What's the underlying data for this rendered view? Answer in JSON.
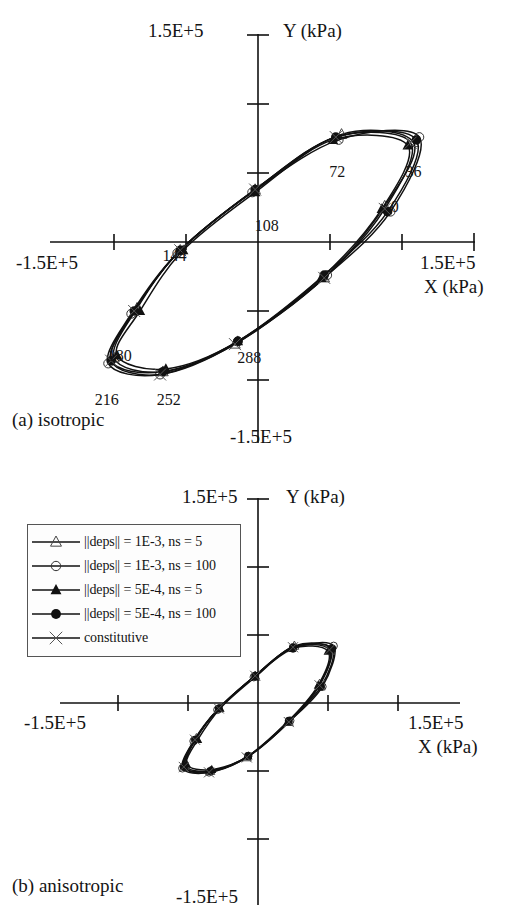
{
  "figure": {
    "panels": [
      {
        "key": "a",
        "caption": "(a) isotropic"
      },
      {
        "key": "b",
        "caption": "(b) anisotropic"
      }
    ]
  },
  "axes": {
    "y_top_label": "1.5E+5",
    "y_bottom_label": "-1.5E+5",
    "x_left_label": "-1.5E+5",
    "x_right_label": "1.5E+5",
    "y_axis_name": "Y (kPa)",
    "x_axis_name": "X (kPa)"
  },
  "legend": {
    "entries": [
      {
        "marker": "open-triangle",
        "label": "||deps|| = 1E-3, ns = 5"
      },
      {
        "marker": "open-circle",
        "label": "||deps|| = 1E-3, ns = 100"
      },
      {
        "marker": "filled-triangle",
        "label": "||deps|| = 5E-4, ns = 5"
      },
      {
        "marker": "filled-circle",
        "label": "||deps|| = 5E-4, ns = 100"
      },
      {
        "marker": "cross",
        "label": "constitutive"
      }
    ]
  },
  "point_labels_a": [
    "0",
    "36",
    "72",
    "108",
    "144",
    "180",
    "216",
    "252",
    "288",
    "324"
  ],
  "chart_data": {
    "type": "line",
    "title": "",
    "xlabel": "X (kPa)",
    "ylabel": "Y (kPa)",
    "xlim": [
      -150000,
      150000
    ],
    "ylim": [
      -150000,
      150000
    ],
    "xticks": [
      -150000,
      -100000,
      -50000,
      0,
      50000,
      100000,
      150000
    ],
    "yticks": [
      -150000,
      -100000,
      -50000,
      0,
      50000,
      100000,
      150000
    ],
    "xticklabels": [
      "-1.5E+5",
      "",
      "",
      "",
      "",
      "",
      "1.5E+5"
    ],
    "yticklabels": [
      "-1.5E+5",
      "",
      "",
      "",
      "",
      "",
      "1.5E+5"
    ],
    "grid": false,
    "legend_position": "outside-left-middle",
    "panels": [
      {
        "name": "(a) isotropic",
        "annotations": [
          {
            "text": "0",
            "x": 95000,
            "y": 22000
          },
          {
            "text": "36",
            "x": 108000,
            "y": 47000
          },
          {
            "text": "72",
            "x": 55000,
            "y": 47000
          },
          {
            "text": "108",
            "x": 6000,
            "y": 8000
          },
          {
            "text": "144",
            "x": -58000,
            "y": -14000
          },
          {
            "text": "180",
            "x": -96000,
            "y": -86000
          },
          {
            "text": "216",
            "x": -105000,
            "y": -118000
          },
          {
            "text": "252",
            "x": -62000,
            "y": -118000
          },
          {
            "text": "288",
            "x": -6000,
            "y": -88000
          }
        ],
        "series": [
          {
            "name": "||deps|| = 1E-3, ns = 5",
            "marker": "open-triangle",
            "phase_deg": [
              0,
              36,
              72,
              108,
              144,
              180,
              216,
              252,
              288,
              324
            ],
            "x": [
              88000,
              108000,
              58000,
              -2000,
              -54000,
              -84000,
              -100000,
              -66000,
              -16000,
              46000
            ],
            "y": [
              26000,
              72000,
              78000,
              38000,
              -6000,
              -48000,
              -84000,
              -94000,
              -74000,
              -26000
            ]
          },
          {
            "name": "||deps|| = 1E-3, ns = 100",
            "marker": "open-circle",
            "phase_deg": [
              0,
              36,
              72,
              108,
              144,
              180,
              216,
              252,
              288,
              324
            ],
            "x": [
              92000,
              112000,
              56000,
              -4000,
              -56000,
              -88000,
              -104000,
              -68000,
              -14000,
              48000
            ],
            "y": [
              22000,
              76000,
              74000,
              36000,
              -8000,
              -52000,
              -88000,
              -96000,
              -72000,
              -24000
            ]
          },
          {
            "name": "||deps|| = 5E-4, ns = 5",
            "marker": "filled-triangle",
            "phase_deg": [
              0,
              36,
              72,
              108,
              144,
              180,
              216,
              252,
              288,
              324
            ],
            "x": [
              86000,
              104000,
              52000,
              -2000,
              -52000,
              -82000,
              -98000,
              -64000,
              -14000,
              44000
            ],
            "y": [
              24000,
              70000,
              74000,
              36000,
              -6000,
              -50000,
              -82000,
              -92000,
              -72000,
              -26000
            ]
          },
          {
            "name": "||deps|| = 5E-4, ns = 100",
            "marker": "filled-circle",
            "phase_deg": [
              0,
              36,
              72,
              108,
              144,
              180,
              216,
              252,
              288,
              324
            ],
            "x": [
              90000,
              110000,
              54000,
              -2000,
              -54000,
              -86000,
              -102000,
              -66000,
              -14000,
              46000
            ],
            "y": [
              22000,
              74000,
              76000,
              38000,
              -6000,
              -50000,
              -86000,
              -94000,
              -72000,
              -24000
            ]
          },
          {
            "name": "constitutive",
            "marker": "cross",
            "phase_deg": [
              0,
              36,
              72,
              108,
              144,
              180,
              216,
              252,
              288,
              324
            ],
            "x": [
              88000,
              106000,
              54000,
              -2000,
              -54000,
              -86000,
              -102000,
              -68000,
              -16000,
              46000
            ],
            "y": [
              24000,
              72000,
              76000,
              38000,
              -6000,
              -50000,
              -86000,
              -96000,
              -74000,
              -26000
            ]
          }
        ]
      },
      {
        "name": "(b) anisotropic",
        "annotations": [],
        "series": [
          {
            "name": "||deps|| = 1E-3, ns = 5",
            "marker": "open-triangle",
            "phase_deg": [
              0,
              36,
              72,
              108,
              144,
              180,
              216,
              252,
              288,
              324
            ],
            "x": [
              44000,
              52000,
              26000,
              -2000,
              -28000,
              -44000,
              -52000,
              -34000,
              -8000,
              22000
            ],
            "y": [
              14000,
              40000,
              42000,
              20000,
              -4000,
              -26000,
              -46000,
              -50000,
              -40000,
              -14000
            ]
          },
          {
            "name": "||deps|| = 1E-3, ns = 100",
            "marker": "open-circle",
            "phase_deg": [
              0,
              36,
              72,
              108,
              144,
              180,
              216,
              252,
              288,
              324
            ],
            "x": [
              46000,
              54000,
              25000,
              -3000,
              -29000,
              -46000,
              -54000,
              -35000,
              -7000,
              23000
            ],
            "y": [
              12000,
              42000,
              40000,
              19000,
              -5000,
              -28000,
              -48000,
              -51000,
              -39000,
              -13000
            ]
          },
          {
            "name": "||deps|| = 5E-4, ns = 5",
            "marker": "filled-triangle",
            "phase_deg": [
              0,
              36,
              72,
              108,
              144,
              180,
              216,
              252,
              288,
              324
            ],
            "x": [
              43000,
              50000,
              24000,
              -2000,
              -27000,
              -43000,
              -51000,
              -33000,
              -7000,
              21000
            ],
            "y": [
              13000,
              38000,
              40000,
              19000,
              -4000,
              -27000,
              -45000,
              -49000,
              -39000,
              -14000
            ]
          },
          {
            "name": "||deps|| = 5E-4, ns = 100",
            "marker": "filled-circle",
            "phase_deg": [
              0,
              36,
              72,
              108,
              144,
              180,
              216,
              252,
              288,
              324
            ],
            "x": [
              45000,
              53000,
              25000,
              -2000,
              -28000,
              -45000,
              -53000,
              -34000,
              -7000,
              22000
            ],
            "y": [
              12000,
              40000,
              41000,
              20000,
              -4000,
              -27000,
              -47000,
              -50000,
              -39000,
              -13000
            ]
          },
          {
            "name": "constitutive",
            "marker": "cross",
            "phase_deg": [
              0,
              36,
              72,
              108,
              144,
              180,
              216,
              252,
              288,
              324
            ],
            "x": [
              44000,
              51000,
              25000,
              -2000,
              -28000,
              -45000,
              -53000,
              -35000,
              -8000,
              22000
            ],
            "y": [
              13000,
              39000,
              41000,
              20000,
              -4000,
              -27000,
              -47000,
              -51000,
              -40000,
              -14000
            ]
          }
        ]
      }
    ]
  }
}
